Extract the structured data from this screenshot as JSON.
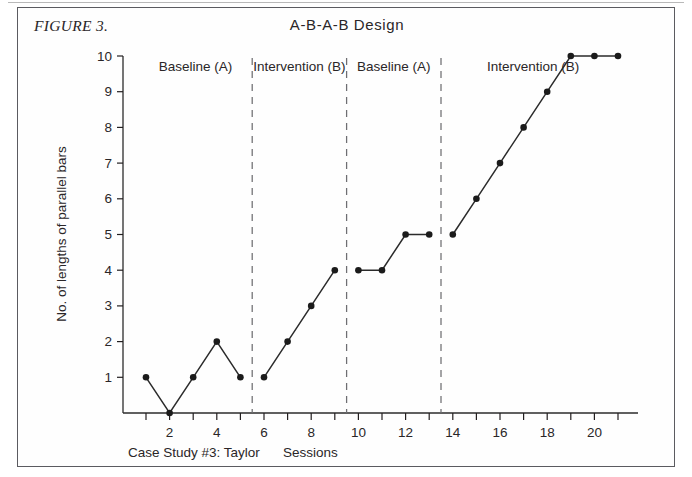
{
  "figure": {
    "label": "FIGURE 3.",
    "title": "A-B-A-B Design",
    "caption_left": "Case Study #3: Taylor",
    "caption_center": "Sessions"
  },
  "colors": {
    "ink": "#231f20",
    "frame": "#5b5b60",
    "divider": "#6e6e72",
    "marker": "#1b1b1b",
    "line": "#2b2b2b"
  },
  "chart_data": {
    "type": "line",
    "title": "A-B-A-B Design",
    "xlabel": "Sessions",
    "ylabel": "No. of lengths of parallel bars",
    "xlim": [
      0,
      22
    ],
    "ylim": [
      0,
      10.6
    ],
    "grid": false,
    "legend_position": "none",
    "x_ticks": [
      1,
      2,
      3,
      4,
      5,
      6,
      7,
      8,
      9,
      10,
      11,
      12,
      13,
      14,
      15,
      16,
      17,
      18,
      19,
      20,
      21
    ],
    "x_tick_labels": [
      "",
      "2",
      "",
      "4",
      "",
      "6",
      "",
      "8",
      "",
      "10",
      "",
      "12",
      "",
      "14",
      "",
      "16",
      "",
      "18",
      "",
      "20",
      ""
    ],
    "y_ticks": [
      1,
      2,
      3,
      4,
      5,
      6,
      7,
      8,
      9,
      10
    ],
    "y_tick_labels": [
      "1",
      "2",
      "3",
      "4",
      "5",
      "6",
      "7",
      "8",
      "9",
      "10"
    ],
    "marker": "filled-circle",
    "phase_dividers_at_x": [
      5.5,
      9.5,
      13.5
    ],
    "phases": [
      {
        "label": "Baseline (A)",
        "label_center_x": 3.1,
        "x": [
          1,
          2,
          3,
          4,
          5
        ],
        "y": [
          1,
          0,
          1,
          2,
          1
        ]
      },
      {
        "label": "Intervention (B)",
        "label_center_x": 7.5,
        "x": [
          6,
          7,
          8,
          9
        ],
        "y": [
          1,
          2,
          3,
          4
        ]
      },
      {
        "label": "Baseline (A)",
        "label_center_x": 11.5,
        "x": [
          10,
          11,
          12,
          13
        ],
        "y": [
          4,
          4,
          5,
          5
        ]
      },
      {
        "label": "Intervention (B)",
        "label_center_x": 17.4,
        "x": [
          14,
          15,
          16,
          17,
          18,
          19,
          20,
          21
        ],
        "y": [
          5,
          6,
          7,
          8,
          9,
          10,
          10,
          10
        ]
      }
    ]
  }
}
